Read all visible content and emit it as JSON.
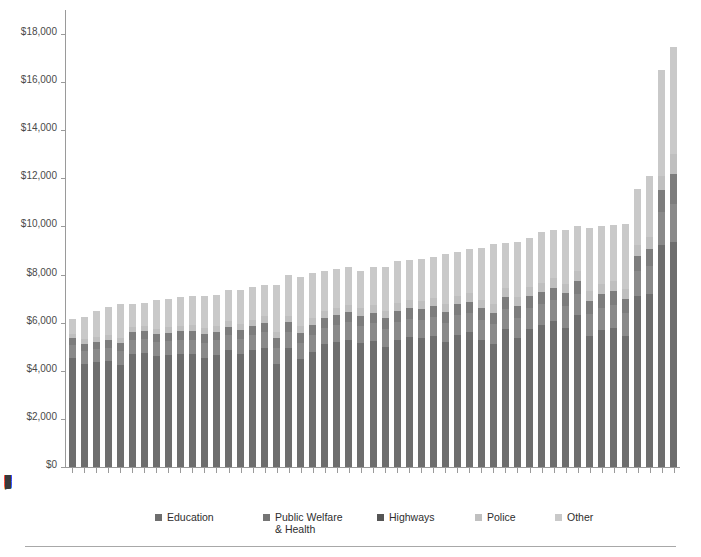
{
  "chart_data": {
    "type": "bar",
    "subtype": "stacked-bar",
    "title": "",
    "xlabel": "",
    "ylabel": "",
    "ylim": [
      0,
      19000
    ],
    "grid": false,
    "legend_position": "bottom",
    "y_ticks": [
      "$0",
      "$2,000",
      "$4,000",
      "$6,000",
      "$8,000",
      "$10,000",
      "$12,000",
      "$14,000",
      "$16,000",
      "$18,000"
    ],
    "y_tick_values": [
      0,
      2000,
      4000,
      6000,
      8000,
      10000,
      12000,
      14000,
      16000,
      18000
    ],
    "categories": [
      "AR",
      "TN",
      "GA",
      "ID",
      "AZ",
      "MO",
      "OK",
      "TX",
      "NC",
      "KY",
      "SD",
      "NH",
      "IN",
      "UT",
      "NV",
      "WV",
      "AL",
      "CO",
      "MI",
      "VA",
      "FL",
      "SC",
      "MT",
      "OH",
      "NE",
      "PA",
      "MS",
      "IL",
      "KS",
      "OR",
      "WI",
      "ME",
      "IA",
      "ND",
      "MD",
      "RI",
      "WA",
      "MA",
      "MN",
      "CT",
      "VT",
      "LA",
      "NM",
      "CA",
      "DE",
      "NJ",
      "HI",
      "NY",
      "WY",
      "DC",
      "AK"
    ],
    "series": [
      {
        "name": "Education",
        "color": "#6e6e6e",
        "values": [
          4550,
          4300,
          4350,
          4400,
          4250,
          4700,
          4750,
          4600,
          4650,
          4700,
          4700,
          4550,
          4650,
          4850,
          4700,
          4850,
          4950,
          4300,
          4950,
          4500,
          4800,
          5100,
          5200,
          5300,
          5150,
          5250,
          5000,
          5300,
          5400,
          5350,
          5450,
          5200,
          5500,
          5600,
          5300,
          5100,
          5750,
          5350,
          5750,
          5900,
          6050,
          5800,
          6300,
          5450,
          5700,
          5800,
          5450,
          7100,
          7200,
          9250,
          9350
        ]
      },
      {
        "name": "Public Welfare & Health",
        "color": "#8a8a8a",
        "values": [
          520,
          530,
          560,
          560,
          570,
          570,
          580,
          590,
          600,
          600,
          600,
          610,
          610,
          620,
          630,
          640,
          650,
          660,
          660,
          670,
          680,
          690,
          700,
          710,
          720,
          730,
          740,
          750,
          760,
          770,
          780,
          790,
          800,
          810,
          820,
          830,
          840,
          850,
          860,
          870,
          880,
          890,
          900,
          910,
          920,
          930,
          940,
          1050,
          1150,
          1350,
          1600
        ]
      },
      {
        "name": "Highways",
        "color": "#7d7d7d",
        "values": [
          280,
          290,
          300,
          310,
          320,
          330,
          330,
          340,
          340,
          350,
          350,
          360,
          360,
          370,
          370,
          380,
          390,
          390,
          400,
          400,
          410,
          410,
          420,
          420,
          430,
          430,
          440,
          440,
          450,
          450,
          460,
          460,
          470,
          470,
          480,
          480,
          490,
          490,
          500,
          510,
          520,
          530,
          540,
          550,
          560,
          570,
          580,
          620,
          700,
          900,
          1250
        ]
      },
      {
        "name": "Police",
        "color": "#bfbfbf",
        "values": [
          180,
          190,
          200,
          200,
          210,
          210,
          220,
          220,
          230,
          230,
          240,
          240,
          250,
          250,
          260,
          260,
          270,
          270,
          280,
          280,
          290,
          290,
          300,
          300,
          310,
          310,
          320,
          320,
          330,
          330,
          340,
          340,
          350,
          350,
          360,
          360,
          370,
          370,
          380,
          380,
          390,
          400,
          410,
          420,
          430,
          440,
          450,
          480,
          520,
          620,
          800
        ]
      },
      {
        "name": "Other",
        "color": "#c9c9c9",
        "values": [
          620,
          930,
          1080,
          1180,
          1430,
          950,
          950,
          1200,
          1170,
          1180,
          1230,
          1370,
          1300,
          1260,
          1420,
          1370,
          1320,
          1930,
          1680,
          2050,
          1900,
          1650,
          1600,
          1600,
          1550,
          1600,
          1800,
          1750,
          1680,
          1750,
          1700,
          2050,
          1810,
          1830,
          2150,
          2510,
          1850,
          2280,
          2050,
          2130,
          2020,
          2250,
          1880,
          2620,
          2420,
          2330,
          2690,
          2300,
          2530,
          4380,
          4450
        ]
      }
    ],
    "totals": [
      6150,
      6240,
      6490,
      6650,
      6780,
      6760,
      6830,
      6950,
      6990,
      7060,
      7120,
      7130,
      7170,
      7350,
      7380,
      7500,
      7580,
      7550,
      7970,
      7900,
      8080,
      8140,
      8220,
      8330,
      8160,
      8320,
      8300,
      8560,
      8620,
      8650,
      8730,
      8840,
      8930,
      9060,
      9110,
      9280,
      9300,
      9350,
      9540,
      9790,
      9860,
      9870,
      10030,
      9950,
      10030,
      10070,
      10110,
      11550,
      12100,
      16500,
      17450
    ]
  },
  "legend": {
    "items": [
      {
        "label": "Education",
        "color": "#6e6e6e",
        "left": 0
      },
      {
        "label": "Public Welfare\n& Health",
        "color": "#757575",
        "left": 108
      },
      {
        "label": "Highways",
        "color": "#555555",
        "left": 222
      },
      {
        "label": "Police",
        "color": "#c0c0c0",
        "left": 320
      },
      {
        "label": "Other",
        "color": "#c9c9c9",
        "left": 400
      }
    ]
  },
  "axes": {
    "y_axis_color": "#9a9a9a",
    "x_axis_color": "#9a9a9a"
  }
}
